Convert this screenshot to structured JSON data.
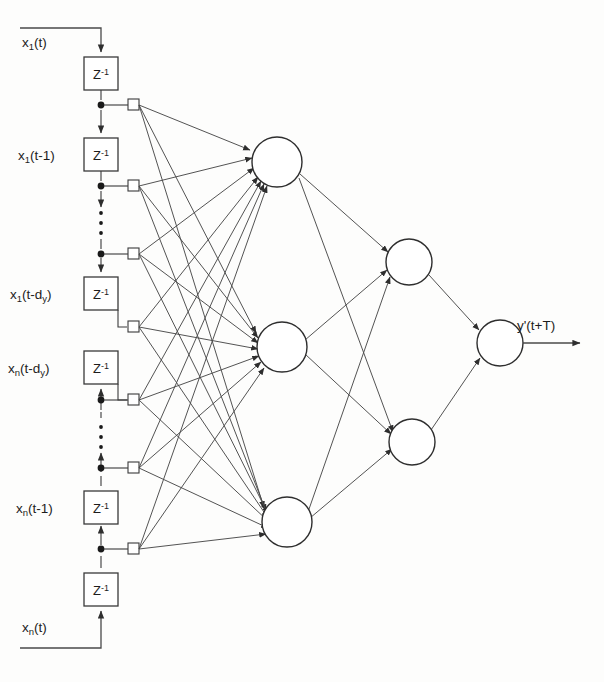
{
  "figure": {
    "type": "neural-network-diagram",
    "background_color": "#fdfdfc",
    "line_color": "#3a3a3a"
  },
  "labels": {
    "input_top": "x₁(t)",
    "delay1_top": "x₁(t-1)",
    "delay_dy_top": "x₁(t-dᵧ)",
    "delay_dy_bottom": "xₙ(t-dᵧ)",
    "delay1_bottom": "xₙ(t-1)",
    "input_bottom": "xₙ(t)",
    "output": "y'(t+T)",
    "delay_operator": "Z⁻¹"
  },
  "label_parts": {
    "input_top": {
      "base": "x",
      "sub": "1",
      "rest": "(t)"
    },
    "delay1_top": {
      "base": "x",
      "sub": "1",
      "rest": "(t-1)"
    },
    "delay_dy_top": {
      "base": "x",
      "sub": "1",
      "rest": "(t-d",
      "sub2": "y",
      "tail": ")"
    },
    "delay_dy_bottom": {
      "base": "x",
      "sub": "n",
      "rest": "(t-d",
      "sub2": "y",
      "tail": ")"
    },
    "delay1_bottom": {
      "base": "x",
      "sub": "n",
      "rest": "(t-1)"
    },
    "input_bottom": {
      "base": "x",
      "sub": "n",
      "rest": "(t)"
    },
    "output": {
      "base": "y'(t+T)"
    },
    "delay_operator": {
      "base": "Z",
      "sup": "-1"
    }
  },
  "structure": {
    "delay_blocks": [
      {
        "id": "z-top-1",
        "label": "Z-1",
        "x": 84,
        "y": 57,
        "w": 34,
        "h": 33,
        "chain": "upper"
      },
      {
        "id": "z-top-2",
        "label": "Z-1",
        "x": 84,
        "y": 138,
        "w": 34,
        "h": 33,
        "chain": "upper"
      },
      {
        "id": "z-top-3",
        "label": "Z-1",
        "x": 84,
        "y": 277,
        "w": 34,
        "h": 33,
        "chain": "upper"
      },
      {
        "id": "z-bot-3",
        "label": "Z-1",
        "x": 84,
        "y": 351,
        "w": 34,
        "h": 33,
        "chain": "lower"
      },
      {
        "id": "z-bot-2",
        "label": "Z-1",
        "x": 84,
        "y": 491,
        "w": 34,
        "h": 33,
        "chain": "lower"
      },
      {
        "id": "z-bot-1",
        "label": "Z-1",
        "x": 84,
        "y": 573,
        "w": 34,
        "h": 33,
        "chain": "lower"
      }
    ],
    "tap_points": [
      {
        "id": "tap-1",
        "dot_x": 101,
        "dot_y": 105,
        "sq_x": 131,
        "sq_y": 105
      },
      {
        "id": "tap-2",
        "dot_x": 101,
        "dot_y": 186,
        "sq_x": 131,
        "sq_y": 186
      },
      {
        "id": "tap-3",
        "dot_x": 101,
        "dot_y": 254,
        "sq_x": 131,
        "sq_y": 254
      },
      {
        "id": "tap-4",
        "dot_x": 101,
        "dot_y": 327,
        "sq_x": 131,
        "sq_y": 327
      },
      {
        "id": "tap-5",
        "dot_x": 101,
        "dot_y": 400,
        "sq_x": 131,
        "sq_y": 400
      },
      {
        "id": "tap-6",
        "dot_x": 101,
        "dot_y": 468,
        "sq_x": 131,
        "sq_y": 468
      },
      {
        "id": "tap-7",
        "dot_x": 101,
        "dot_y": 549,
        "sq_x": 131,
        "sq_y": 549
      }
    ],
    "hidden_layer_1": [
      {
        "id": "h1",
        "cx": 277,
        "cy": 162,
        "r": 25
      },
      {
        "id": "h2",
        "cx": 282,
        "cy": 347,
        "r": 25
      },
      {
        "id": "h3",
        "cx": 287,
        "cy": 522,
        "r": 25
      }
    ],
    "hidden_layer_2": [
      {
        "id": "h4",
        "cx": 409,
        "cy": 262,
        "r": 23
      },
      {
        "id": "h5",
        "cx": 412,
        "cy": 442,
        "r": 23
      }
    ],
    "output_layer": [
      {
        "id": "out",
        "cx": 500,
        "cy": 343,
        "r": 23
      }
    ],
    "vertical_dots": [
      {
        "chain": "upper",
        "x": 101,
        "y_start": 210,
        "y_end": 240
      },
      {
        "chain": "lower",
        "x": 101,
        "y_start": 424,
        "y_end": 454
      }
    ]
  },
  "counts": {
    "taps": 7,
    "hidden_layer_1_neurons": 3,
    "hidden_layer_2_neurons": 2,
    "output_neurons": 1,
    "delay_blocks": 6
  }
}
